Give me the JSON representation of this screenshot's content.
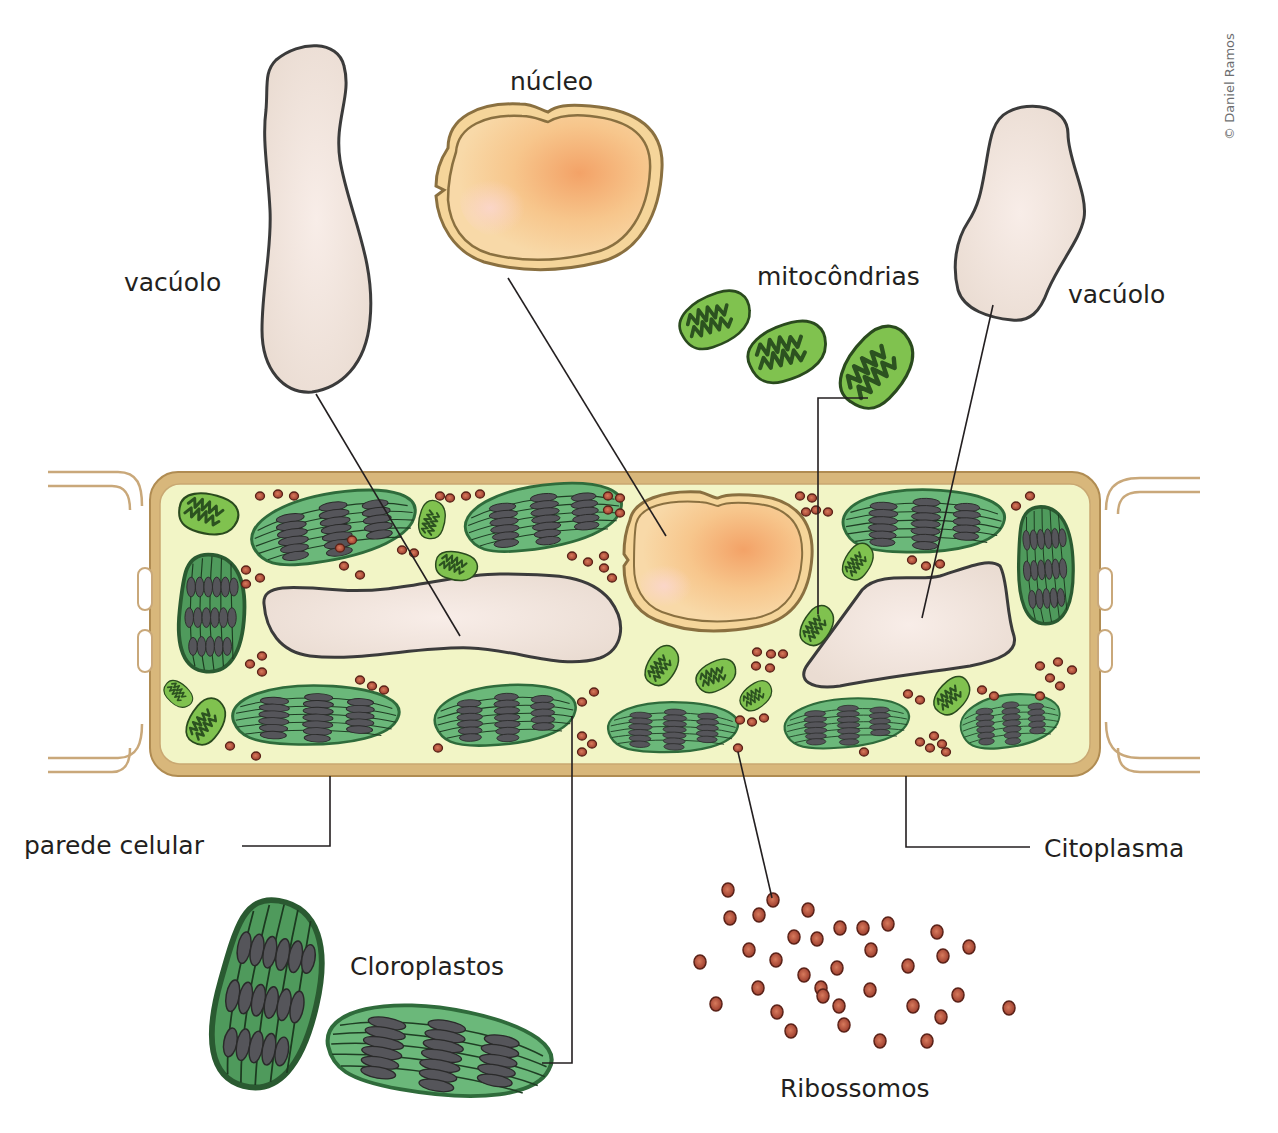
{
  "diagram": {
    "title_cut_off": "",
    "credit": "© Daniel Ramos",
    "labels": {
      "nucleo": "núcleo",
      "vacuolo_left": "vacúolo",
      "vacuolo_right": "vacúolo",
      "mitocondrias": "mitocôndrias",
      "parede_celular": "parede celular",
      "citoplasma": "Citoplasma",
      "cloroplastos": "Cloroplastos",
      "ribossomos": "Ribossomos"
    },
    "colors": {
      "cell_wall": "#d7b47a",
      "cytoplasm": "#f2f5c8",
      "vacuole": "#efe1d8",
      "nucleus": "#f7c98d",
      "nucleus_center": "#f2a066",
      "chloroplast": "#4e9a5a",
      "chloroplast_light": "#6fbd7a",
      "grana": "#55555a",
      "mitochondria": "#7fbf4d",
      "mitochondria_crista": "#2f5a22",
      "ribosome": "#b5503f",
      "outline": "#3c3c3c"
    }
  }
}
